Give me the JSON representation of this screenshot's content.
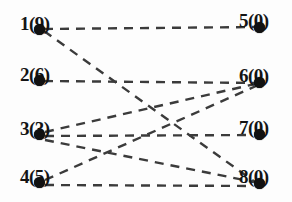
{
  "figure": {
    "type": "bipartite-graph",
    "title": "",
    "edge_style": "dashed",
    "edge_color": "#3b3b3b",
    "node_color": "#111111",
    "background": "#fdfdfd"
  },
  "nodes": {
    "left": [
      {
        "id": "1",
        "label": "1(9)",
        "value": "9",
        "x": 20,
        "y": 28,
        "dot_x": 39,
        "dot_y": 29
      },
      {
        "id": "2",
        "label": "2(6)",
        "value": "6",
        "x": 20,
        "y": 79,
        "dot_x": 39,
        "dot_y": 80
      },
      {
        "id": "3",
        "label": "3(3)",
        "value": "3",
        "x": 20,
        "y": 133,
        "dot_x": 39,
        "dot_y": 134
      },
      {
        "id": "4",
        "label": "4(5)",
        "value": "5",
        "x": 20,
        "y": 181,
        "dot_x": 39,
        "dot_y": 182
      }
    ],
    "right": [
      {
        "id": "5",
        "label": "5(0)",
        "value": "0",
        "x": 239,
        "y": 25,
        "dot_x": 259,
        "dot_y": 27
      },
      {
        "id": "6",
        "label": "6(0)",
        "value": "0",
        "x": 239,
        "y": 80,
        "dot_x": 259,
        "dot_y": 82
      },
      {
        "id": "7",
        "label": "7(0)",
        "value": "0",
        "x": 239,
        "y": 132,
        "dot_x": 259,
        "dot_y": 134
      },
      {
        "id": "8",
        "label": "8(0)",
        "value": "0",
        "x": 239,
        "y": 181,
        "dot_x": 259,
        "dot_y": 183
      }
    ]
  },
  "edges": [
    {
      "from": "1",
      "to": "5",
      "x1": 44,
      "y1": 29,
      "x2": 255,
      "y2": 27
    },
    {
      "from": "1",
      "to": "8",
      "x1": 44,
      "y1": 31,
      "x2": 255,
      "y2": 182
    },
    {
      "from": "2",
      "to": "6",
      "x1": 44,
      "y1": 81,
      "x2": 255,
      "y2": 83
    },
    {
      "from": "3",
      "to": "6",
      "x1": 45,
      "y1": 132,
      "x2": 255,
      "y2": 84
    },
    {
      "from": "3",
      "to": "7",
      "x1": 45,
      "y1": 136,
      "x2": 253,
      "y2": 135
    },
    {
      "from": "3",
      "to": "8",
      "x1": 45,
      "y1": 140,
      "x2": 254,
      "y2": 182
    },
    {
      "from": "4",
      "to": "6",
      "x1": 45,
      "y1": 180,
      "x2": 256,
      "y2": 86
    },
    {
      "from": "4",
      "to": "8",
      "x1": 45,
      "y1": 185,
      "x2": 253,
      "y2": 186
    }
  ]
}
